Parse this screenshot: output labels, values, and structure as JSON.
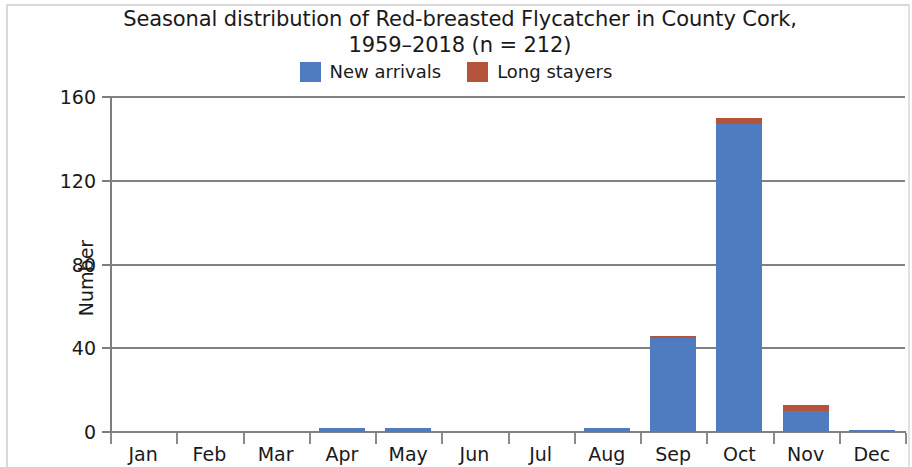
{
  "chart_data": {
    "type": "bar",
    "title": "Seasonal distribution of Red-breasted Flycatcher in County Cork,\n1959–2018 (n = 212)",
    "xlabel": "",
    "ylabel": "Number",
    "categories": [
      "Jan",
      "Feb",
      "Mar",
      "Apr",
      "May",
      "Jun",
      "Jul",
      "Aug",
      "Sep",
      "Oct",
      "Nov",
      "Dec"
    ],
    "series": [
      {
        "name": "New arrivals",
        "color": "#4f7cc0",
        "values": [
          0,
          0,
          0,
          2,
          2,
          0,
          0,
          2,
          45,
          147,
          10,
          1
        ]
      },
      {
        "name": "Long stayers",
        "color": "#b5543a",
        "values": [
          0,
          0,
          0,
          0,
          0,
          0,
          0,
          0,
          1,
          3,
          3,
          0
        ]
      }
    ],
    "stacked": true,
    "ylim": [
      0,
      160
    ],
    "yticks": [
      0,
      40,
      80,
      120,
      160
    ],
    "ytick_labels": [
      "0",
      "40",
      "80",
      "120",
      "160"
    ],
    "grid": "horizontal",
    "legend_position": "top-center",
    "annotations": []
  },
  "style": {
    "grid_color": "#808080",
    "axis_color": "#7d7d7d",
    "text_color": "#1a1a1a",
    "background": "#fefefe"
  }
}
